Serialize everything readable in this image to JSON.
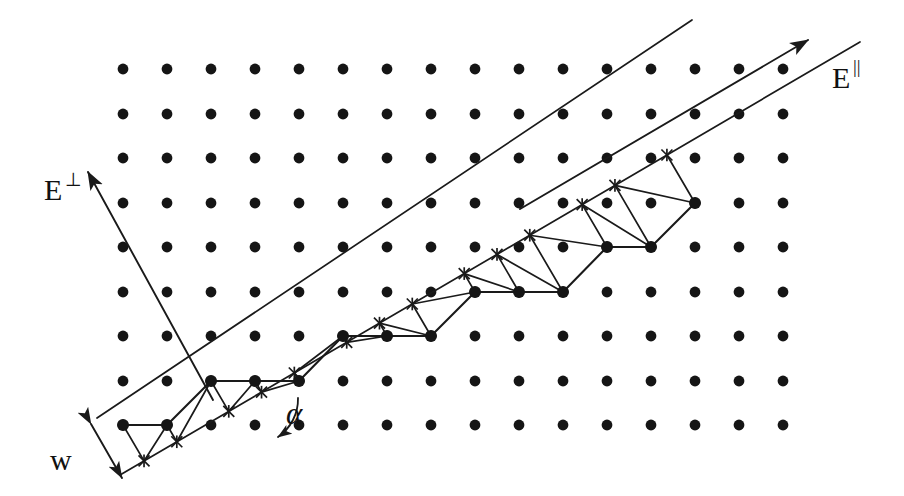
{
  "figure": {
    "domain": "Diagram",
    "background_color": "#ffffff",
    "ink_color": "#1a1a1a",
    "width": 904,
    "height": 496
  },
  "lattice": {
    "name": "square-lattice-of-atoms",
    "origin_x": 123,
    "origin_y": 69,
    "spacing_x": 44,
    "spacing_y": 44.5,
    "columns": 16,
    "rows": 9,
    "dot_radius": 5.4,
    "dot_color": "#151515"
  },
  "terrace_band": {
    "name": "vicinal-terrace-band",
    "slope_rise": 1,
    "slope_run": 3,
    "angle_degrees": 18.4,
    "upper_line": {
      "x1": 97,
      "y1": 418,
      "x2": 692,
      "y2": 20
    },
    "lower_line": {
      "x1": 120,
      "y1": 475,
      "x2": 860,
      "y2": 42
    }
  },
  "staircase": {
    "name": "atomic-step-staircase",
    "corner_dots": [
      {
        "x": 123,
        "y": 425
      },
      {
        "x": 167,
        "y": 425
      },
      {
        "x": 211,
        "y": 381
      },
      {
        "x": 255,
        "y": 381
      },
      {
        "x": 299,
        "y": 381
      },
      {
        "x": 343,
        "y": 336
      },
      {
        "x": 387,
        "y": 336
      },
      {
        "x": 431,
        "y": 336
      },
      {
        "x": 475,
        "y": 292
      },
      {
        "x": 519,
        "y": 292
      },
      {
        "x": 563,
        "y": 292
      },
      {
        "x": 607,
        "y": 247
      },
      {
        "x": 651,
        "y": 247
      },
      {
        "x": 695,
        "y": 203
      }
    ]
  },
  "star_markers": {
    "name": "lattice-site-star-markers",
    "count": 15,
    "glyph": "asterisk-cross",
    "size": 11
  },
  "labels": {
    "e_parallel": {
      "name": "e-parallel-label",
      "base": "E",
      "superscript": "||",
      "x": 832,
      "y": 88,
      "description": "Electric field component parallel to the steps"
    },
    "e_perpendicular": {
      "name": "e-perpendicular-label",
      "base": "E",
      "superscript": "⊥",
      "x": 44,
      "y": 200,
      "description": "Electric field component perpendicular to the steps"
    },
    "alpha": {
      "name": "alpha-angle-label",
      "text": "α",
      "x": 286,
      "y": 424,
      "description": "Miscut angle between step direction and lattice row"
    },
    "w": {
      "name": "terrace-width-label",
      "text": "w",
      "x": 50,
      "y": 470,
      "description": "Terrace width measured perpendicular to the step edges"
    }
  },
  "axes": {
    "e_parallel_arrow": {
      "name": "e-parallel-arrow",
      "from_x": 520,
      "from_y": 209,
      "to_x": 808,
      "to_y": 40
    },
    "e_perpendicular_arrow": {
      "name": "e-perpendicular-arrow",
      "from_x": 213,
      "from_y": 400,
      "to_x": 88,
      "to_y": 172
    },
    "width_arrow": {
      "name": "terrace-width-arrow",
      "from_x": 91,
      "from_y": 424,
      "to_x": 122,
      "to_y": 478
    }
  }
}
